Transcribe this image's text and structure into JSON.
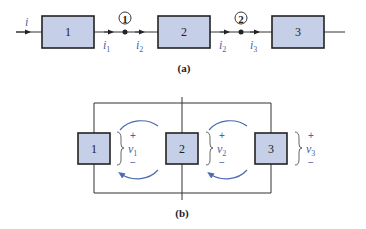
{
  "diagram_a": {
    "caption": "(a)",
    "input_current": "i",
    "blocks": [
      {
        "label": "1"
      },
      {
        "label": "2"
      },
      {
        "label": "3"
      }
    ],
    "nodes": [
      {
        "label": "1"
      },
      {
        "label": "2"
      }
    ],
    "currents": [
      {
        "sym": "i",
        "sub": "1"
      },
      {
        "sym": "i",
        "sub": "2"
      },
      {
        "sym": "i",
        "sub": "2"
      },
      {
        "sym": "i",
        "sub": "3"
      }
    ]
  },
  "diagram_b": {
    "caption": "(b)",
    "blocks": [
      {
        "label": "1"
      },
      {
        "label": "2"
      },
      {
        "label": "3"
      }
    ],
    "voltages": [
      {
        "sym": "v",
        "sub": "1",
        "plus": "+",
        "minus": "−"
      },
      {
        "sym": "v",
        "sub": "2",
        "plus": "+",
        "minus": "−"
      },
      {
        "sym": "v",
        "sub": "3",
        "plus": "+",
        "minus": "−"
      }
    ]
  },
  "colors": {
    "block_fill": "#c5d0e8",
    "label_blue": "#4a5fa8",
    "arc_blue": "#4a6cb0"
  }
}
